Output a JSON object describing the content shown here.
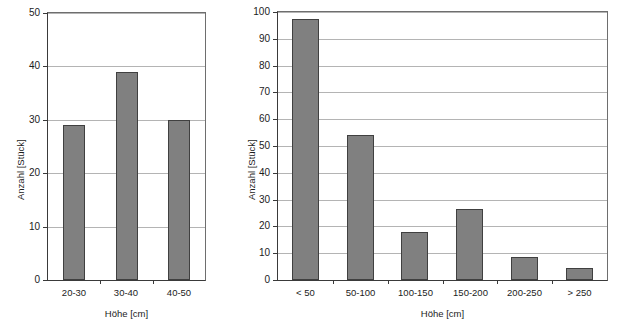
{
  "chart_data": [
    {
      "id": "left",
      "type": "bar",
      "title": "",
      "xlabel": "Höhe [cm]",
      "ylabel": "Anzahl [Stück]",
      "categories": [
        "20-30",
        "30-40",
        "40-50"
      ],
      "values": [
        29,
        39,
        30
      ],
      "ylim": [
        0,
        50
      ],
      "ytick_step": 10,
      "yticks": [
        0,
        10,
        20,
        30,
        40,
        50
      ],
      "grid": true,
      "legend": "none",
      "bar_fill": "#808080",
      "bar_border": "#404040",
      "gridline_color": "#b4b4b4",
      "axis_color": "#3a3a3a"
    },
    {
      "id": "right",
      "type": "bar",
      "title": "",
      "xlabel": "Höhe [cm]",
      "ylabel": "Anzahl [Stück]",
      "categories": [
        "< 50",
        "50-100",
        "100-150",
        "150-200",
        "200-250",
        "> 250"
      ],
      "values": [
        97.5,
        54,
        18,
        26.5,
        8.5,
        4.5
      ],
      "ylim": [
        0,
        100
      ],
      "ytick_step": 10,
      "yticks": [
        0,
        10,
        20,
        30,
        40,
        50,
        60,
        70,
        80,
        90,
        100
      ],
      "grid": true,
      "legend": "none",
      "bar_fill": "#808080",
      "bar_border": "#404040",
      "gridline_color": "#b4b4b4",
      "axis_color": "#3a3a3a"
    }
  ]
}
